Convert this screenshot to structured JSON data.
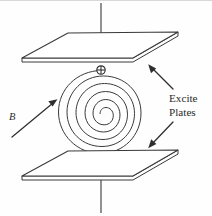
{
  "figure": {
    "domain_type": "physics-schematic",
    "background_color": "#fefefe",
    "ink_color": "#3a3a3a",
    "width": 212,
    "height": 216
  },
  "labels": {
    "callout_line1": "Excite",
    "callout_line2": "Plates",
    "field_symbol": "B"
  },
  "components": {
    "top_plate": {
      "name": "top excite plate",
      "corners": "22,62 68,33 178,32 133,62",
      "thickness_px": 4
    },
    "bottom_plate": {
      "name": "bottom excite plate",
      "corners": "22,180 68,151 178,150 133,180",
      "thickness_px": 4
    },
    "spiral_coil": {
      "name": "flat spiral coil",
      "turns": 3,
      "center_x": 100,
      "center_y": 112,
      "outer_radius": 42,
      "winding": "counterclockwise-inward"
    },
    "terminal_marker": {
      "name": "coil terminal",
      "symbol": "circled-cross",
      "x": 101,
      "y": 70,
      "radius": 4.2
    },
    "axis": {
      "name": "vertical symmetry axis",
      "segments": [
        {
          "style": "solid",
          "y_start": 3,
          "y_end": 48
        },
        {
          "style": "solid",
          "y_start": 48,
          "y_end": 62
        },
        {
          "style": "dashed",
          "y_start": 163,
          "y_end": 180
        },
        {
          "style": "solid",
          "y_start": 180,
          "y_end": 213
        }
      ]
    },
    "field_arrow": {
      "name": "magnetic field direction arrow",
      "from_x": 12,
      "from_y": 136,
      "to_x": 56,
      "to_y": 100
    },
    "callout_arrow_top": {
      "name": "callout arrow to top plate",
      "from_x": 172,
      "from_y": 88,
      "to_x": 148,
      "to_y": 64
    },
    "callout_arrow_bottom": {
      "name": "callout arrow to bottom plate",
      "from_x": 172,
      "from_y": 122,
      "to_x": 148,
      "to_y": 148
    }
  }
}
